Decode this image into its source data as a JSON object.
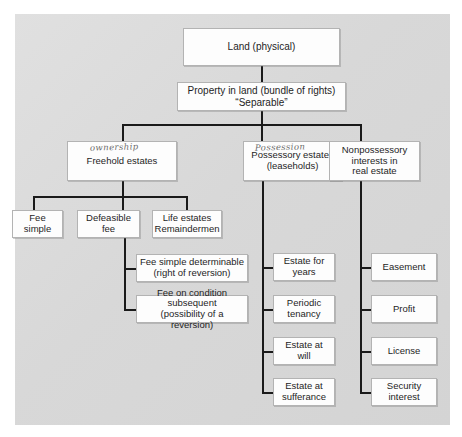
{
  "diagram": {
    "background_color": "#dcdcdc",
    "box_fill": "#fdfdfd",
    "line_color": "#1a1a1a",
    "nodes": {
      "land": "Land (physical)",
      "property_in_land": "Property in land (bundle of rights)\n“Separable”",
      "freehold": "Freehold estates",
      "possessory": "Possessory estates\n(leaseholds)",
      "nonpossessory": "Nonpossessory\ninterests in\nreal estate",
      "fee_simple": "Fee\nsimple",
      "defeasible_fee": "Defeasible\nfee",
      "life_estates": "Life estates\nRemaindermen",
      "fee_simple_determinable": "Fee simple determinable\n(right of reversion)",
      "fee_on_condition_subsequent": "Fee on condition subsequent\n(possibility of a reversion)",
      "estate_for_years": "Estate for\nyears",
      "periodic_tenancy": "Periodic\ntenancy",
      "estate_at_will": "Estate at\nwill",
      "estate_at_sufferance": "Estate at\nsufferance",
      "easement": "Easement",
      "profit": "Profit",
      "license": "License",
      "security_interest": "Security\ninterest"
    },
    "annotations": {
      "ownership": "ownership",
      "possession": "Possession"
    }
  }
}
